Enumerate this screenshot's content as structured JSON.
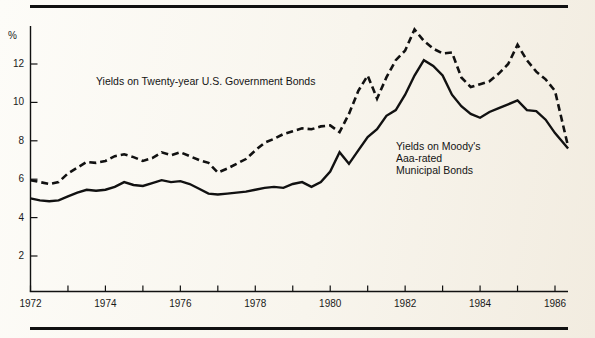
{
  "figure": {
    "percent_symbol": "%",
    "background_color": "#f7f4ec",
    "ink_color": "#111111"
  },
  "labels": {
    "government_bonds": "Yields on Twenty-year U.S. Government Bonds",
    "municipal_line1": "Yields on Moody's",
    "municipal_line2": "Aaa-rated",
    "municipal_line3": "Municipal Bonds"
  },
  "chart_data": {
    "type": "line",
    "title": "",
    "subtitle": "",
    "xlabel": "",
    "ylabel": "%",
    "xlim": [
      1972,
      1986.35
    ],
    "ylim": [
      0,
      14
    ],
    "grid": false,
    "legend_position": "inline-annotations",
    "yticks": [
      2,
      4,
      6,
      8,
      10,
      12
    ],
    "ytick_labels": [
      "2",
      "4",
      "6",
      "8",
      "10",
      "12"
    ],
    "xticks": [
      1972,
      1973,
      1974,
      1975,
      1976,
      1977,
      1978,
      1979,
      1980,
      1981,
      1982,
      1983,
      1984,
      1985,
      1986
    ],
    "xtick_labels_major": [
      "1972",
      "1974",
      "1976",
      "1978",
      "1980",
      "1982",
      "1984",
      "1986"
    ],
    "xticks_major": [
      1972,
      1974,
      1976,
      1978,
      1980,
      1982,
      1984,
      1986
    ],
    "series": [
      {
        "name": "Yields on Twenty-year U.S. Government Bonds",
        "style": "dashed",
        "color": "#111111",
        "x": [
          1972.0,
          1972.25,
          1972.5,
          1972.75,
          1973.0,
          1973.25,
          1973.5,
          1973.75,
          1974.0,
          1974.25,
          1974.5,
          1974.75,
          1975.0,
          1975.25,
          1975.5,
          1975.75,
          1976.0,
          1976.25,
          1976.5,
          1976.75,
          1977.0,
          1977.25,
          1977.5,
          1977.75,
          1978.0,
          1978.25,
          1978.5,
          1978.75,
          1979.0,
          1979.25,
          1979.5,
          1979.75,
          1980.0,
          1980.25,
          1980.5,
          1980.75,
          1981.0,
          1981.25,
          1981.5,
          1981.75,
          1982.0,
          1982.25,
          1982.5,
          1982.75,
          1983.0,
          1983.25,
          1983.5,
          1983.75,
          1984.0,
          1984.25,
          1984.5,
          1984.75,
          1985.0,
          1985.25,
          1985.5,
          1985.75,
          1986.0,
          1986.35
        ],
        "y": [
          5.95,
          5.85,
          5.75,
          5.85,
          6.3,
          6.6,
          6.9,
          6.85,
          6.95,
          7.2,
          7.3,
          7.15,
          6.95,
          7.1,
          7.4,
          7.25,
          7.4,
          7.2,
          7.0,
          6.85,
          6.35,
          6.55,
          6.8,
          7.05,
          7.5,
          7.9,
          8.1,
          8.35,
          8.5,
          8.65,
          8.6,
          8.75,
          8.8,
          8.45,
          9.4,
          10.6,
          11.4,
          10.2,
          11.3,
          12.2,
          12.7,
          13.8,
          13.2,
          12.8,
          12.55,
          12.6,
          11.3,
          10.8,
          10.95,
          11.1,
          11.5,
          12.0,
          13.0,
          12.2,
          11.6,
          11.2,
          10.6,
          7.7
        ],
        "notes": "Dashed upper curve; peak ~13.8% in 1982, secondary peak ~13.0% in 1985"
      },
      {
        "name": "Yields on Moody's Aaa-rated Municipal Bonds",
        "style": "solid",
        "color": "#111111",
        "x": [
          1972.0,
          1972.25,
          1972.5,
          1972.75,
          1973.0,
          1973.25,
          1973.5,
          1973.75,
          1974.0,
          1974.25,
          1974.5,
          1974.75,
          1975.0,
          1975.25,
          1975.5,
          1975.75,
          1976.0,
          1976.25,
          1976.5,
          1976.75,
          1977.0,
          1977.25,
          1977.5,
          1977.75,
          1978.0,
          1978.25,
          1978.5,
          1978.75,
          1979.0,
          1979.25,
          1979.5,
          1979.75,
          1980.0,
          1980.25,
          1980.5,
          1980.75,
          1981.0,
          1981.25,
          1981.5,
          1981.75,
          1982.0,
          1982.25,
          1982.5,
          1982.75,
          1983.0,
          1983.25,
          1983.5,
          1983.75,
          1984.0,
          1984.25,
          1984.5,
          1984.75,
          1985.0,
          1985.25,
          1985.5,
          1985.75,
          1986.0,
          1986.35
        ],
        "y": [
          5.0,
          4.9,
          4.85,
          4.9,
          5.1,
          5.3,
          5.45,
          5.4,
          5.45,
          5.6,
          5.85,
          5.7,
          5.65,
          5.8,
          5.95,
          5.85,
          5.9,
          5.75,
          5.5,
          5.25,
          5.2,
          5.25,
          5.3,
          5.35,
          5.45,
          5.55,
          5.6,
          5.55,
          5.75,
          5.85,
          5.6,
          5.85,
          6.4,
          7.4,
          6.8,
          7.5,
          8.2,
          8.6,
          9.3,
          9.6,
          10.4,
          11.4,
          12.2,
          11.9,
          11.4,
          10.4,
          9.8,
          9.4,
          9.2,
          9.5,
          9.7,
          9.9,
          10.1,
          9.6,
          9.55,
          9.1,
          8.4,
          7.6
        ],
        "notes": "Solid lower curve; peak ~12.2% in 1982, secondary peak ~10.1% in 1985"
      }
    ]
  }
}
